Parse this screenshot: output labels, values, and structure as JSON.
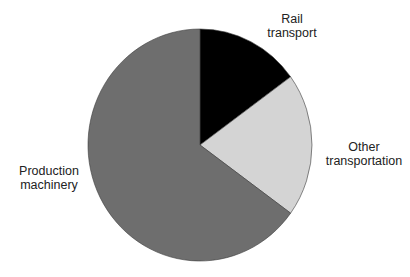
{
  "chart_data": {
    "type": "pie",
    "title": "",
    "slices": [
      {
        "label": "Rail transport",
        "label_lines": [
          "Rail",
          "transport"
        ],
        "value": 15,
        "color": "#000000"
      },
      {
        "label": "Other transportation",
        "label_lines": [
          "Other",
          "transportation"
        ],
        "value": 20,
        "color": "#d4d4d4"
      },
      {
        "label": "Production machinery",
        "label_lines": [
          "Production",
          "machinery"
        ],
        "value": 65,
        "color": "#6e6e6e"
      }
    ],
    "start_angle_deg": 0,
    "direction": "clockwise",
    "legend": "none (direct labels)",
    "units": "percent (estimated)"
  },
  "labels": {
    "rail": [
      "Rail",
      "transport"
    ],
    "other": [
      "Other",
      "transportation"
    ],
    "production": [
      "Production",
      "machinery"
    ]
  }
}
